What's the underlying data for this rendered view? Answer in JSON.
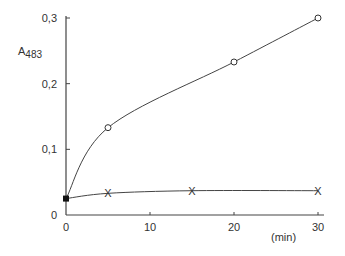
{
  "chart_data": {
    "type": "line",
    "title": "",
    "xlabel": "(min)",
    "ylabel": "A483",
    "ylabel_main": "A",
    "ylabel_sub": "483",
    "xlim": [
      0,
      30
    ],
    "ylim": [
      0,
      0.3
    ],
    "x_ticks": [
      "0",
      "10",
      "20",
      "30"
    ],
    "y_ticks": [
      "0",
      "0,1",
      "0,2",
      "0,3"
    ],
    "grid": false,
    "legend": "none",
    "series": [
      {
        "name": "circles",
        "marker": "o",
        "x": [
          0,
          5,
          20,
          30
        ],
        "y": [
          0.025,
          0.133,
          0.233,
          0.3
        ]
      },
      {
        "name": "crosses",
        "marker": "x",
        "x": [
          0,
          5,
          15,
          30
        ],
        "y": [
          0.025,
          0.033,
          0.037,
          0.037
        ]
      }
    ]
  }
}
